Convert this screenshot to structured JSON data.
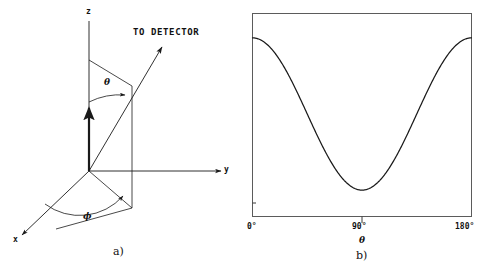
{
  "figure": {
    "background_color": "#ffffff",
    "ink_color": "#1a1a1a",
    "panels": [
      {
        "id": "a",
        "caption": "a)",
        "type": "coordinate-diagram",
        "axis_labels": {
          "z": "z",
          "y": "y",
          "x": "x"
        },
        "annotations": {
          "detector": "TO DETECTOR",
          "polar_angle": "θ",
          "azimuthal_angle": "ϕ"
        }
      },
      {
        "id": "b",
        "caption": "b)",
        "type": "plot",
        "xlabel": "θ",
        "ticks": [
          "0°",
          "90°",
          "180°"
        ]
      }
    ]
  },
  "chart_data": {
    "type": "line",
    "title": "",
    "xlabel": "θ",
    "ylabel": "",
    "xlim": [
      0,
      180
    ],
    "ylim": [
      0,
      1
    ],
    "xtick_values": [
      0,
      90,
      180
    ],
    "xtick_labels": [
      "0°",
      "90°",
      "180°"
    ],
    "ytick_labels": [],
    "grid": false,
    "legend": null,
    "frame": "box",
    "series": [
      {
        "name": "angular distribution",
        "description": "W(θ) proportional to cos^2(θ), minimum at 90 degrees",
        "x": [
          0,
          10,
          20,
          30,
          40,
          50,
          60,
          70,
          80,
          90,
          100,
          110,
          120,
          130,
          140,
          150,
          160,
          170,
          180
        ],
        "y": [
          0.88,
          0.866,
          0.824,
          0.757,
          0.67,
          0.571,
          0.468,
          0.368,
          0.28,
          0.13,
          0.28,
          0.368,
          0.468,
          0.571,
          0.67,
          0.757,
          0.824,
          0.866,
          0.88
        ]
      }
    ]
  }
}
